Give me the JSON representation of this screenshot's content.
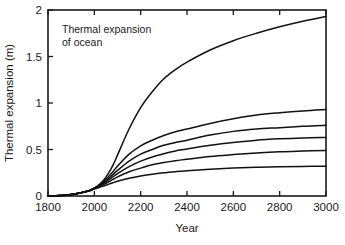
{
  "chart_data": {
    "type": "line",
    "title": "",
    "annotation": [
      "Thermal expansion",
      "of ocean"
    ],
    "xlabel": "Year",
    "ylabel": "Thermal expansion (m)",
    "xlim": [
      1800,
      3000
    ],
    "ylim": [
      0,
      2
    ],
    "xticks": [
      1800,
      2000,
      2200,
      2400,
      2600,
      2800,
      3000
    ],
    "xtick_labels": [
      "1800",
      "2000",
      "2200",
      "2400",
      "2600",
      "2800",
      "3000"
    ],
    "yticks": [
      0,
      0.5,
      1,
      1.5,
      2
    ],
    "ytick_labels": [
      "0",
      "0.5",
      "1",
      "1.5",
      "2"
    ],
    "grid": false,
    "legend": "none",
    "line_color": "#111111",
    "x": [
      1800,
      1850,
      1900,
      1950,
      1980,
      2000,
      2020,
      2040,
      2060,
      2080,
      2100,
      2150,
      2200,
      2250,
      2300,
      2350,
      2400,
      2500,
      2600,
      2700,
      2800,
      2900,
      3000
    ],
    "series": [
      {
        "name": "curve-1",
        "values": [
          0.0,
          0.005,
          0.015,
          0.04,
          0.06,
          0.085,
          0.12,
          0.17,
          0.24,
          0.33,
          0.44,
          0.72,
          0.95,
          1.12,
          1.26,
          1.36,
          1.44,
          1.57,
          1.67,
          1.75,
          1.82,
          1.88,
          1.93
        ]
      },
      {
        "name": "curve-2",
        "values": [
          0.0,
          0.005,
          0.015,
          0.04,
          0.06,
          0.085,
          0.115,
          0.155,
          0.205,
          0.26,
          0.32,
          0.45,
          0.54,
          0.6,
          0.65,
          0.69,
          0.72,
          0.78,
          0.83,
          0.87,
          0.895,
          0.915,
          0.93
        ]
      },
      {
        "name": "curve-3",
        "values": [
          0.0,
          0.005,
          0.015,
          0.04,
          0.06,
          0.085,
          0.11,
          0.145,
          0.185,
          0.23,
          0.275,
          0.375,
          0.45,
          0.5,
          0.545,
          0.575,
          0.6,
          0.655,
          0.695,
          0.72,
          0.735,
          0.75,
          0.76
        ]
      },
      {
        "name": "curve-4",
        "values": [
          0.0,
          0.005,
          0.015,
          0.04,
          0.06,
          0.085,
          0.105,
          0.135,
          0.17,
          0.205,
          0.24,
          0.315,
          0.375,
          0.42,
          0.455,
          0.485,
          0.505,
          0.545,
          0.575,
          0.6,
          0.615,
          0.625,
          0.63
        ]
      },
      {
        "name": "curve-5",
        "values": [
          0.0,
          0.005,
          0.015,
          0.04,
          0.06,
          0.082,
          0.1,
          0.125,
          0.15,
          0.178,
          0.205,
          0.26,
          0.3,
          0.335,
          0.36,
          0.38,
          0.395,
          0.425,
          0.445,
          0.462,
          0.475,
          0.483,
          0.49
        ]
      },
      {
        "name": "curve-6",
        "values": [
          0.0,
          0.005,
          0.015,
          0.038,
          0.055,
          0.075,
          0.09,
          0.108,
          0.125,
          0.142,
          0.158,
          0.19,
          0.215,
          0.235,
          0.25,
          0.262,
          0.272,
          0.288,
          0.3,
          0.308,
          0.314,
          0.318,
          0.32
        ]
      }
    ]
  }
}
